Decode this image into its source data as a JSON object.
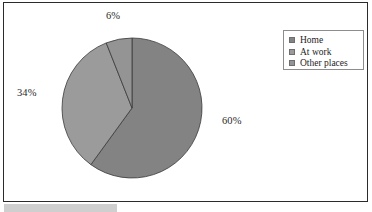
{
  "chart_data": {
    "type": "pie",
    "title": "",
    "subtitle": "",
    "categories": [
      "Home",
      "At work",
      "Other places"
    ],
    "values": [
      60,
      34,
      6
    ],
    "labels": [
      "60%",
      "34%",
      "6%"
    ],
    "colors": [
      "#838383",
      "#9b9b9b",
      "#949494"
    ],
    "start_angle_deg": 0,
    "direction": "clockwise",
    "legend": {
      "position": "top-right",
      "entries": [
        {
          "label": "Home",
          "color": "#838383"
        },
        {
          "label": "At work",
          "color": "#9b9b9b"
        },
        {
          "label": "Other places",
          "color": "#949494"
        }
      ]
    },
    "grid": false,
    "xlabel": "",
    "ylabel": ""
  },
  "pie": {
    "slices": [
      {
        "name": "Home",
        "percent_label": "60%",
        "value": 60,
        "color": "#838383"
      },
      {
        "name": "At work",
        "percent_label": "34%",
        "value": 34,
        "color": "#9b9b9b"
      },
      {
        "name": "Other places",
        "percent_label": "6%",
        "value": 6,
        "color": "#949494"
      }
    ],
    "outline_color": "#3a3a3a"
  },
  "legend": {
    "items": [
      {
        "label": "Home",
        "color": "#838383"
      },
      {
        "label": "At work",
        "color": "#9b9b9b"
      },
      {
        "label": "Other places",
        "color": "#949494"
      }
    ]
  },
  "frame": {
    "border_color": "#2b2b2b",
    "background": "#ffffff"
  },
  "decoration": {
    "bottom_band_color": "#cfcfcf"
  }
}
